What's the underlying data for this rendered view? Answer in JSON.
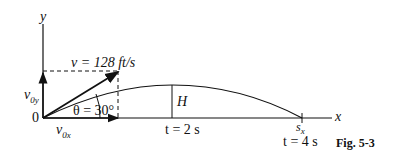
{
  "figure": {
    "caption": "Fig. 5-3",
    "axes": {
      "x_label": "x",
      "y_label": "y",
      "origin_label": "0"
    },
    "velocity": {
      "label": "v = 128 ft/s",
      "magnitude": 128,
      "unit": "ft/s"
    },
    "components": {
      "vertical": "v",
      "vertical_sub": "0y",
      "horizontal": "v",
      "horizontal_sub": "0x"
    },
    "angle": {
      "label": "θ = 30°",
      "degrees": 30
    },
    "max_height_label": "H",
    "time_mid": {
      "label": "t = 2 s",
      "seconds": 2
    },
    "range": {
      "label": "s",
      "sub": "x"
    },
    "time_end": {
      "label": "t = 4 s",
      "seconds": 4
    }
  }
}
